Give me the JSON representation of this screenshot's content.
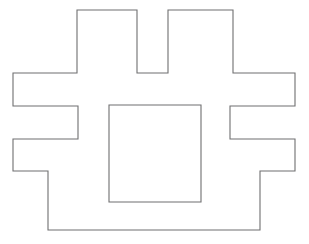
{
  "canvas": {
    "width": 309,
    "height": 244,
    "background_color": "#ffffff",
    "title": "Rectilinear polygon outline with inner square"
  },
  "figure": {
    "name": "rectilinear-polygon-figure",
    "stroke_color": "#6f6f70",
    "stroke_width": 1.1,
    "fill": "none"
  },
  "shapes": [
    {
      "name": "outer-polygon",
      "type": "polygon",
      "closed": true,
      "stroke_color": "#6f6f70",
      "stroke_width": 1.1,
      "fill": "none",
      "points": [
        [
          77,
          10
        ],
        [
          137,
          10
        ],
        [
          137,
          73
        ],
        [
          168,
          73
        ],
        [
          168,
          10
        ],
        [
          233,
          10
        ],
        [
          233,
          73
        ],
        [
          295,
          73
        ],
        [
          295,
          106
        ],
        [
          230,
          106
        ],
        [
          230,
          139
        ],
        [
          295,
          139
        ],
        [
          295,
          171
        ],
        [
          260,
          171
        ],
        [
          260,
          230
        ],
        [
          48,
          230
        ],
        [
          48,
          171
        ],
        [
          13,
          171
        ],
        [
          13,
          139
        ],
        [
          78,
          139
        ],
        [
          78,
          106
        ],
        [
          13,
          106
        ],
        [
          13,
          73
        ],
        [
          77,
          73
        ]
      ]
    },
    {
      "name": "inner-square",
      "type": "rect",
      "closed": true,
      "stroke_color": "#6f6f70",
      "stroke_width": 1.1,
      "fill": "none",
      "x": 109,
      "y": 105,
      "width": 92,
      "height": 97,
      "points": [
        [
          109,
          105
        ],
        [
          201,
          105
        ],
        [
          201,
          202
        ],
        [
          109,
          202
        ]
      ]
    }
  ]
}
